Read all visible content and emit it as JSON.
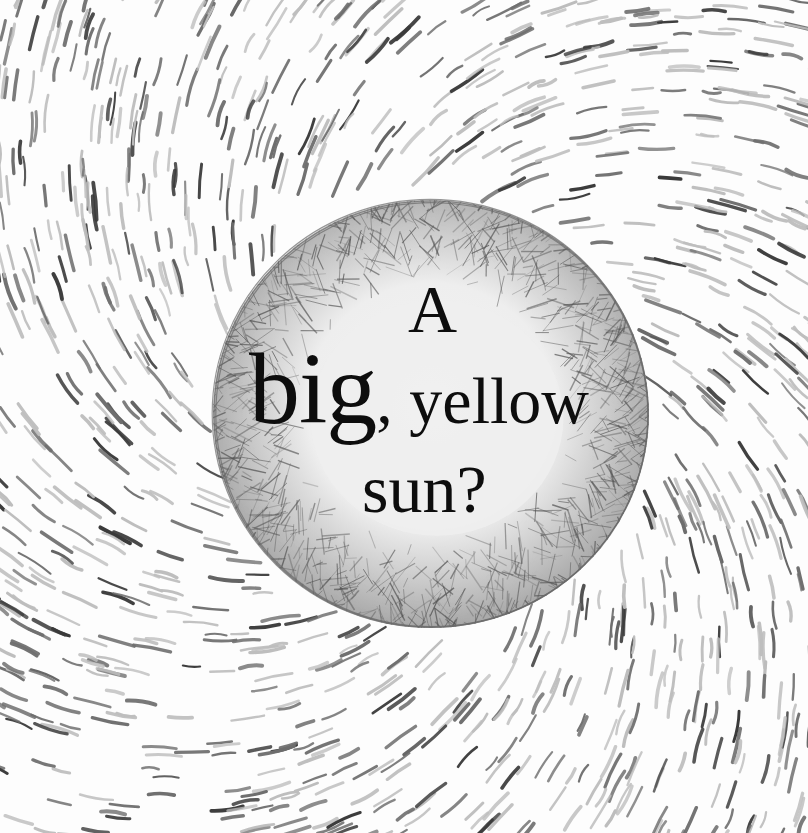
{
  "illustration": {
    "subject": "pencil-drawn sun with swirling radiating strokes",
    "background_color": "#fdfdfd",
    "stroke_colors": {
      "dark": "#3a3a3a",
      "mid": "#6e6e6e",
      "light": "#bdbdbd"
    },
    "sun": {
      "center_x": 431,
      "center_y": 414,
      "radius_x": 218,
      "radius_y": 214,
      "inner_fill": "#eeeeee",
      "hatch_color": "#555555",
      "outline_color": "#6a6a6a"
    }
  },
  "caption": {
    "line1": "A",
    "line2_emphasis": "big",
    "line2_rest": ", yellow",
    "line3": "sun?",
    "full_text": "A big, yellow sun?"
  }
}
